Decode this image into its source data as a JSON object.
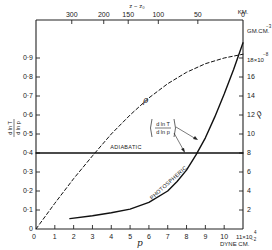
{
  "chart_data": {
    "type": "line",
    "title": "",
    "xlabel": "p",
    "xunit": "DYNE CM.⁻²",
    "x_multiplier_label": "11×10⁴",
    "xlim": [
      0,
      11
    ],
    "x_ticks": [
      "0",
      "1",
      "2",
      "3",
      "4",
      "5",
      "6",
      "7",
      "8",
      "9",
      "10",
      "11×10⁴"
    ],
    "ylabel_left": "(d ln T / d ln p)",
    "ylim_left": [
      0,
      1.0
    ],
    "y_left_ticks": [
      "0",
      "0·1",
      "0·2",
      "0·3",
      "0·4",
      "0·5",
      "0·6",
      "0·7",
      "0·8",
      "0·9"
    ],
    "ylabel_right": "ρ",
    "y_right_unit": "GM.CM.⁻³",
    "y_right_multiplier": "18×10⁻⁸",
    "ylim_right": [
      0,
      21
    ],
    "y_right_ticks": [
      "2",
      "4",
      "6",
      "8",
      "10",
      "12",
      "14",
      "16",
      "18×10⁻⁸"
    ],
    "top_axis_label": "z − z₀",
    "top_axis_unit": "KM.",
    "top_ticks": [
      {
        "label": "300",
        "p": 1.9
      },
      {
        "label": "200",
        "p": 3.6
      },
      {
        "label": "150",
        "p": 4.9
      },
      {
        "label": "100",
        "p": 6.5
      },
      {
        "label": "50",
        "p": 8.6
      },
      {
        "label": "0",
        "p": 11
      }
    ],
    "series": [
      {
        "name": "PHOTOSPHERIC",
        "style": "solid",
        "axis": "left",
        "x": [
          1.8,
          3,
          4,
          5,
          6,
          7,
          7.5,
          8,
          8.5,
          9,
          9.5,
          10,
          10.5,
          11
        ],
        "y": [
          0.055,
          0.07,
          0.085,
          0.105,
          0.14,
          0.2,
          0.25,
          0.31,
          0.39,
          0.48,
          0.59,
          0.71,
          0.84,
          0.98
        ]
      },
      {
        "name": "ADIABATIC",
        "style": "solid",
        "axis": "left",
        "x": [
          0,
          11
        ],
        "y": [
          0.4,
          0.4
        ]
      },
      {
        "name": "ρ",
        "style": "dashed",
        "axis": "right",
        "x": [
          0,
          1,
          2,
          3,
          4,
          5,
          6,
          7,
          8,
          9,
          10,
          11
        ],
        "y": [
          0,
          2.7,
          5.3,
          7.7,
          10.0,
          12.0,
          13.8,
          15.3,
          16.5,
          17.4,
          18.0,
          18.4
        ]
      }
    ],
    "annotations": [
      {
        "text": "ADIABATIC",
        "near": "horizontal line at 0·4"
      },
      {
        "text": "PHOTOSPHERIC",
        "near": "solid curve"
      },
      {
        "text": "ρ",
        "near": "dashed curve"
      },
      {
        "text": "(d ln T / d ln p)",
        "arrows_to": [
          "PHOTOSPHERIC",
          "ADIABATIC"
        ]
      }
    ]
  },
  "labels": {
    "top_axis": "z − z₀",
    "top_unit": "KM.",
    "right_unit": "GM.CM.",
    "right_unit_exp": "−3",
    "right_mult": "18×10",
    "right_mult_exp": "−8",
    "x_label": "p",
    "x_unit": "DYNE CM.",
    "x_unit_exp": "−2",
    "x_last": "11×10",
    "x_last_exp": "4",
    "rho_right": "ρ",
    "rho_curve": "ρ",
    "adiabatic": "ADIABATIC",
    "photospheric": "PHOTOSPHERIC",
    "grad_num": "d ln T",
    "grad_den": "d ln p",
    "left_num": "d ln T",
    "left_den": "d ln p"
  }
}
